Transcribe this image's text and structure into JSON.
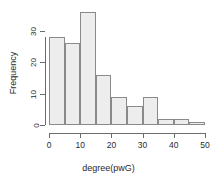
{
  "chart_data": {
    "type": "bar",
    "title": "",
    "subtitle": "",
    "xlabel": "degree(pwG)",
    "ylabel": "Frequency",
    "bin_width": 5,
    "bin_edges": [
      0,
      5,
      10,
      15,
      20,
      25,
      30,
      35,
      40,
      45,
      50
    ],
    "categories": [
      "0-5",
      "5-10",
      "10-15",
      "15-20",
      "20-25",
      "25-30",
      "30-35",
      "35-40",
      "40-45",
      "45-50"
    ],
    "values": [
      28,
      26,
      36,
      16,
      9,
      6,
      9,
      2,
      2,
      1
    ],
    "xlim": [
      0,
      50
    ],
    "ylim": [
      0,
      36
    ],
    "xticks": [
      0,
      10,
      20,
      30,
      40,
      50
    ],
    "xtick_labels": [
      "0",
      "10",
      "20",
      "30",
      "40",
      "50"
    ],
    "yticks": [
      0,
      10,
      20,
      30
    ],
    "ytick_labels": [
      "0",
      "10",
      "20",
      "30"
    ],
    "grid": false,
    "legend": false,
    "legend_position": "none",
    "bar_fill_color": "#ededed",
    "bar_border_color": "#8a8a8a",
    "axis_color": "#6b6b6b",
    "text_color": "#2b2b2b",
    "background_color": "#ffffff"
  }
}
